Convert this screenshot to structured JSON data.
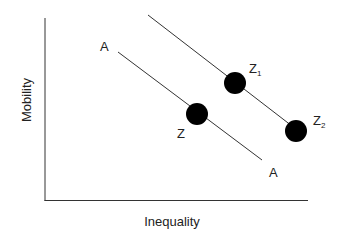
{
  "diagram": {
    "axes": {
      "x_label": "Inequality",
      "y_label": "Mobility"
    },
    "lines": [
      {
        "name": "A",
        "start_label": "A",
        "end_label": "A"
      },
      {
        "name": "upper-parallel",
        "start_label": "",
        "end_label": ""
      }
    ],
    "points": [
      {
        "label": "Z",
        "sub": ""
      },
      {
        "label": "Z",
        "sub": "1"
      },
      {
        "label": "Z",
        "sub": "2"
      }
    ],
    "colors": {
      "line": "#333333",
      "dot": "#000000",
      "text": "#222222"
    }
  }
}
